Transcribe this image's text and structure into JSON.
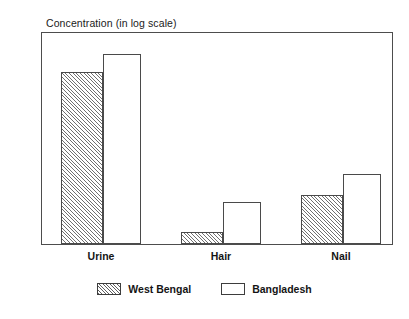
{
  "chart_data": {
    "type": "bar",
    "title": "Concentration (in log scale)",
    "xlabel": "",
    "ylabel": "",
    "categories": [
      "Urine",
      "Hair",
      "Nail"
    ],
    "series": [
      {
        "name": "West Bengal",
        "values": [
          280,
          1.5,
          5
        ]
      },
      {
        "name": "Bangladesh",
        "values": [
          500,
          4,
          10
        ]
      }
    ],
    "yscale": "log",
    "ylim": [
      1,
      1000
    ],
    "yticks": [
      1000,
      100,
      10,
      1
    ],
    "ytick_labels": [
      "1000",
      "100",
      "10",
      "1"
    ],
    "grid": false,
    "legend_position": "bottom-center"
  },
  "axes": {
    "y_tick_labels": [
      "1000",
      "100",
      "10",
      "1"
    ],
    "x_tick_labels": [
      "Urine",
      "Hair",
      "Nail"
    ]
  },
  "legend": {
    "entries": [
      {
        "label": "West Bengal",
        "swatch": "hatched-swatch"
      },
      {
        "label": "Bangladesh",
        "swatch": "open-swatch"
      }
    ]
  }
}
